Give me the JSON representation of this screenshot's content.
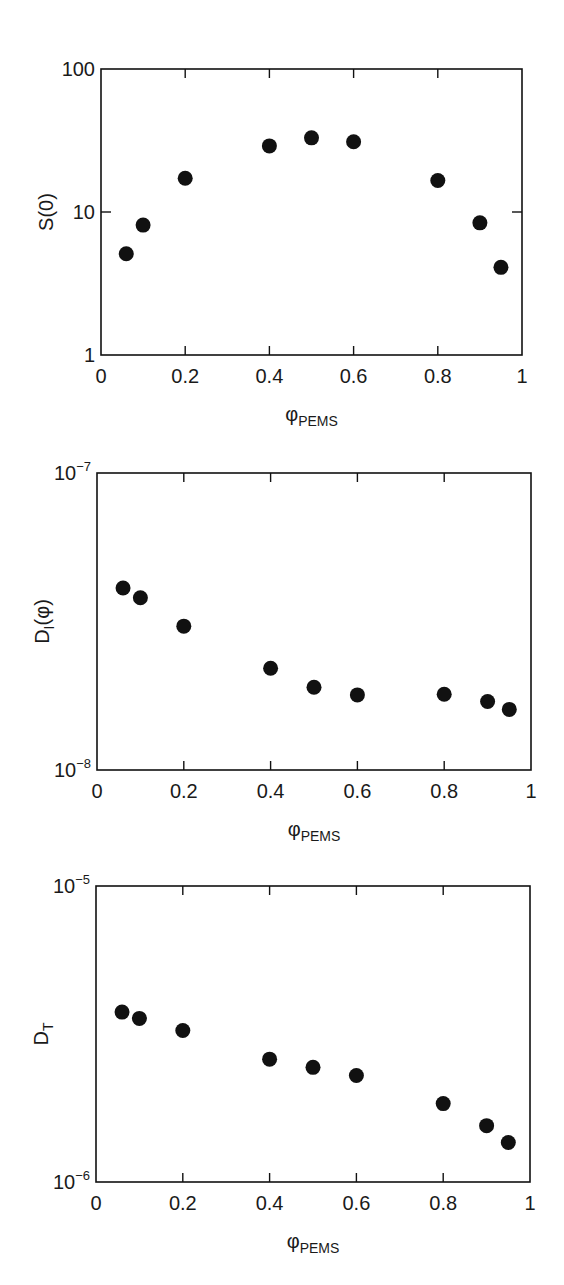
{
  "figure": {
    "background": "#ffffff",
    "ink_color": "#111111"
  },
  "chart_data": [
    {
      "type": "scatter",
      "title": "",
      "xlabel": "φPEMS",
      "xlabel_main": "φ",
      "xlabel_sub": "PEMS",
      "ylabel": "S(0)",
      "ylabel_main": "S(0)",
      "ylabel_sub": "",
      "ylabel_after": "",
      "yscale": "log",
      "xlim": [
        0,
        1
      ],
      "ylim": [
        1,
        100
      ],
      "xticks": [
        0,
        0.2,
        0.4,
        0.6,
        0.8,
        1
      ],
      "xtick_labels": [
        "0",
        "0.2",
        "0.4",
        "0.6",
        "0.8",
        "1"
      ],
      "yticks": [
        1,
        10,
        100
      ],
      "ytick_labels": [
        {
          "base": "1",
          "exp": ""
        },
        {
          "base": "10",
          "exp": ""
        },
        {
          "base": "100",
          "exp": ""
        }
      ],
      "grid": false,
      "legend": null,
      "x": [
        0.06,
        0.1,
        0.2,
        0.4,
        0.5,
        0.6,
        0.8,
        0.9,
        0.95
      ],
      "y": [
        5.1,
        8.1,
        17.2,
        29,
        33,
        31,
        16.6,
        8.4,
        4.1
      ],
      "box": {
        "left": 101,
        "top": 69,
        "right": 522,
        "bottom": 355
      }
    },
    {
      "type": "scatter",
      "title": "",
      "xlabel": "φPEMS",
      "xlabel_main": "φ",
      "xlabel_sub": "PEMS",
      "ylabel": "DI(φ)",
      "ylabel_main": "D",
      "ylabel_sub": "I",
      "ylabel_after": "(φ)",
      "yscale": "log",
      "xlim": [
        0,
        1
      ],
      "ylim": [
        1e-08,
        1e-07
      ],
      "xticks": [
        0,
        0.2,
        0.4,
        0.6,
        0.8,
        1
      ],
      "xtick_labels": [
        "0",
        "0.2",
        "0.4",
        "0.6",
        "0.8",
        "1"
      ],
      "yticks": [
        1e-08,
        1e-07
      ],
      "ytick_labels": [
        {
          "base": "10",
          "exp": "−8"
        },
        {
          "base": "10",
          "exp": "−7"
        }
      ],
      "grid": false,
      "legend": null,
      "x": [
        0.06,
        0.1,
        0.2,
        0.4,
        0.5,
        0.6,
        0.8,
        0.9,
        0.95
      ],
      "y": [
        4.1e-08,
        3.8e-08,
        3.05e-08,
        2.2e-08,
        1.9e-08,
        1.79e-08,
        1.8e-08,
        1.7e-08,
        1.6e-08
      ],
      "box": {
        "left": 97,
        "top": 473,
        "right": 531,
        "bottom": 770
      }
    },
    {
      "type": "scatter",
      "title": "",
      "xlabel": "φPEMS",
      "xlabel_main": "φ",
      "xlabel_sub": "PEMS",
      "ylabel": "DT",
      "ylabel_main": "D",
      "ylabel_sub": "T",
      "ylabel_after": "",
      "yscale": "log",
      "xlim": [
        0,
        1
      ],
      "ylim": [
        1e-06,
        1e-05
      ],
      "xticks": [
        0,
        0.2,
        0.4,
        0.6,
        0.8,
        1
      ],
      "xtick_labels": [
        "0",
        "0.2",
        "0.4",
        "0.6",
        "0.8",
        "1"
      ],
      "yticks": [
        1e-06,
        1e-05
      ],
      "ytick_labels": [
        {
          "base": "10",
          "exp": "−6"
        },
        {
          "base": "10",
          "exp": "−5"
        }
      ],
      "grid": false,
      "legend": null,
      "x": [
        0.06,
        0.1,
        0.2,
        0.4,
        0.5,
        0.6,
        0.8,
        0.9,
        0.95
      ],
      "y": [
        3.75e-06,
        3.57e-06,
        3.25e-06,
        2.6e-06,
        2.44e-06,
        2.29e-06,
        1.84e-06,
        1.55e-06,
        1.36e-06
      ],
      "box": {
        "left": 96,
        "top": 886,
        "right": 530,
        "bottom": 1182
      }
    }
  ]
}
